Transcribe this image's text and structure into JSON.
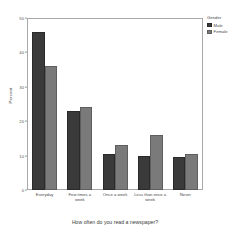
{
  "chart_data": {
    "type": "bar",
    "title": "",
    "subtitle": "",
    "xlabel": "How often do you read a newspaper?",
    "ylabel": "Percent",
    "ylim": [
      0,
      50
    ],
    "yticks": [
      0,
      10,
      20,
      30,
      40,
      50
    ],
    "grid": false,
    "legend_position": "right",
    "legend_title": "Gender",
    "categories": [
      "Everyday",
      "Few times a week",
      "Once a week",
      "Less than once a week",
      "Never"
    ],
    "series": [
      {
        "name": "Male",
        "color": "#3a3a3a",
        "values": [
          46,
          23,
          10.5,
          10,
          9.5
        ]
      },
      {
        "name": "Female",
        "color": "#7a7a7a",
        "values": [
          36,
          24,
          13,
          16,
          10.5
        ]
      }
    ]
  },
  "axes": {
    "y_title": "Percent",
    "x_title": "How often do you read a newspaper?",
    "y_tick_labels": [
      "50",
      "40",
      "30",
      "20",
      "10",
      "0"
    ]
  },
  "legend": {
    "title": "Gender",
    "entries": [
      {
        "label": "Male",
        "color": "#3a3a3a"
      },
      {
        "label": "Female",
        "color": "#7a7a7a"
      }
    ]
  },
  "x_categories": [
    "Everyday",
    "Few times a week",
    "Once a week",
    "Less than once a week",
    "Never"
  ]
}
